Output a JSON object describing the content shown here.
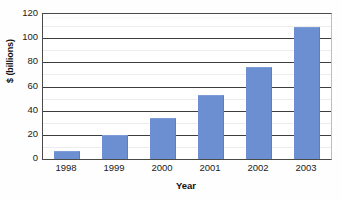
{
  "chart_data": {
    "type": "bar",
    "title": "",
    "xlabel": "Year",
    "ylabel": "$ (billions)",
    "categories": [
      "1998",
      "1999",
      "2000",
      "2001",
      "2002",
      "2003"
    ],
    "values": [
      7,
      20,
      34,
      53,
      76,
      109
    ],
    "ylim": [
      0,
      120
    ],
    "yticks": [
      "0",
      "20",
      "40",
      "60",
      "80",
      "100",
      "120"
    ],
    "ytick_values": [
      0,
      20,
      40,
      60,
      80,
      100,
      120
    ],
    "grid": "horizontal",
    "legend": "none",
    "series": [
      {
        "name": "",
        "values": [
          7,
          20,
          34,
          53,
          76,
          109
        ],
        "color": "#6b8fd0"
      }
    ],
    "colors": {
      "bar": "#6b8fd0",
      "bar_edge": "#5d7fbd",
      "gridline": "#3d3d3d",
      "axis": "#4a4a4a",
      "text": "#1a1a1a",
      "background": "#ffffff"
    }
  },
  "figure": {
    "title_remnant": ""
  }
}
